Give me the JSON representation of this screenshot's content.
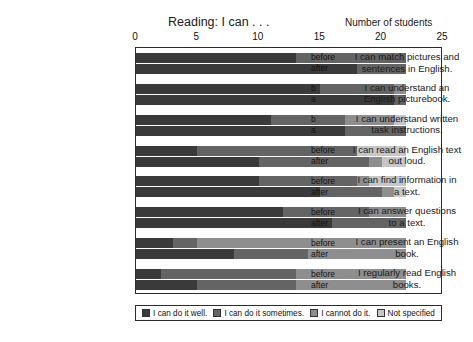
{
  "header": {
    "title": "Reading: I can . . .",
    "axis_caption": "Number of students"
  },
  "group_labels": {
    "before": "before",
    "after": "after",
    "b": "b",
    "a": "a"
  },
  "chart_data": {
    "type": "bar",
    "orientation": "horizontal",
    "stacked": true,
    "title": "Reading: I can . . .",
    "xlabel": "Number of students",
    "ylabel": "",
    "xlim": [
      0,
      25
    ],
    "xticks": [
      0,
      5,
      10,
      15,
      20,
      25
    ],
    "grid": false,
    "legend_position": "bottom",
    "legend": [
      "I can do it well.",
      "I can do it sometimes.",
      "I cannot do it.",
      "Not specified"
    ],
    "colors": [
      "#3a3a3a",
      "#646464",
      "#8e8e8e",
      "#c6c6c6"
    ],
    "categories": [
      "I can match pictures and sentences in English.",
      "I can understand an English picturebook.",
      "I can understand written task instructions.",
      "I can read an English text out loud.",
      "I can find information in a text.",
      "I can answer questions to a text.",
      "I can present an English book.",
      "I regularly read English books."
    ],
    "category_lines": [
      [
        "I can match pictures and",
        "sentences in English."
      ],
      [
        "I can understand an",
        "English picturebook."
      ],
      [
        "I can understand written",
        "task instructions."
      ],
      [
        "I can read an English text",
        "out loud."
      ],
      [
        "I can find information in",
        "a text."
      ],
      [
        "I can answer questions",
        "to a text."
      ],
      [
        "I can present an English",
        "book."
      ],
      [
        "I regularly read English",
        "books."
      ]
    ],
    "rows": [
      {
        "category": "I can match pictures and sentences in English.",
        "series": [
          {
            "name": "before",
            "values": [
              13,
              9,
              0,
              0
            ]
          },
          {
            "name": "after",
            "values": [
              18,
              4,
              0,
              0
            ]
          }
        ]
      },
      {
        "category": "I can understand an English picturebook.",
        "series": [
          {
            "name": "b",
            "values": [
              15,
              6,
              1,
              0
            ]
          },
          {
            "name": "a",
            "values": [
              21,
              1,
              0,
              0
            ]
          }
        ]
      },
      {
        "category": "I can understand written task instructions.",
        "series": [
          {
            "name": "b",
            "values": [
              11,
              6,
              4,
              1
            ]
          },
          {
            "name": "a",
            "values": [
              17,
              5,
              0,
              0
            ]
          }
        ]
      },
      {
        "category": "I can read an English text out loud.",
        "series": [
          {
            "name": "before",
            "values": [
              5,
              13,
              0,
              4
            ]
          },
          {
            "name": "after",
            "values": [
              10,
              9,
              1,
              2
            ]
          }
        ]
      },
      {
        "category": "I can find information in a text.",
        "series": [
          {
            "name": "before",
            "values": [
              10,
              8,
              1,
              3
            ]
          },
          {
            "name": "after",
            "values": [
              15,
              5,
              1,
              1
            ]
          }
        ]
      },
      {
        "category": "I can answer questions to a text.",
        "series": [
          {
            "name": "before",
            "values": [
              12,
              7,
              3,
              0
            ]
          },
          {
            "name": "after",
            "values": [
              16,
              6,
              0,
              0
            ]
          }
        ]
      },
      {
        "category": "I can present an English book.",
        "series": [
          {
            "name": "before",
            "values": [
              3,
              2,
              17,
              0
            ]
          },
          {
            "name": "after",
            "values": [
              8,
              6,
              8,
              0
            ]
          }
        ]
      },
      {
        "category": "I regularly read English books.",
        "series": [
          {
            "name": "before",
            "values": [
              2,
              11,
              9,
              0
            ]
          },
          {
            "name": "after",
            "values": [
              5,
              8,
              9,
              0
            ]
          }
        ]
      }
    ]
  }
}
